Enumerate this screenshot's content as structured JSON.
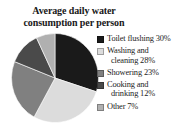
{
  "chart_data": {
    "type": "pie",
    "title": "Average daily water consumption per person",
    "title_lines": [
      "Average daily water",
      "consumption per person"
    ],
    "xlabel": "",
    "ylabel": "",
    "legend_position": "right",
    "grid": false,
    "categories": [
      "Toilet flushing",
      "Washing and cleaning",
      "Showering",
      "Cooking and drinking",
      "Other"
    ],
    "values": [
      30,
      28,
      23,
      12,
      7
    ],
    "value_unit": "%",
    "colors": [
      "#1a1a1a",
      "#dcdcdc",
      "#808080",
      "#4a4a4a",
      "#b0b0b0"
    ],
    "slices": [
      {
        "label": "Toilet flushing",
        "value": 30,
        "legend_text": "Toilet flushing 30%",
        "legend_lines": [
          "Toilet flushing 30%"
        ],
        "color": "#1a1a1a"
      },
      {
        "label": "Washing and cleaning",
        "value": 28,
        "legend_text": "Washing and cleaning 28%",
        "legend_lines": [
          "Washing and",
          "cleaning 28%"
        ],
        "color": "#dcdcdc"
      },
      {
        "label": "Showering",
        "value": 23,
        "legend_text": "Showering 23%",
        "legend_lines": [
          "Showering 23%"
        ],
        "color": "#808080"
      },
      {
        "label": "Cooking and drinking",
        "value": 12,
        "legend_text": "Cooking and drinking 12%",
        "legend_lines": [
          "Cooking and",
          "drinking 12%"
        ],
        "color": "#4a4a4a"
      },
      {
        "label": "Other",
        "value": 7,
        "legend_text": "Other 7%",
        "legend_lines": [
          "Other 7%"
        ],
        "color": "#b0b0b0"
      }
    ]
  }
}
